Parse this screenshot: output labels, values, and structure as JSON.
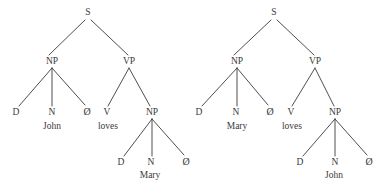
{
  "figure": {
    "title": "",
    "background_color": "#ffffff",
    "ink_color": "#3a3a3a",
    "width": 389,
    "height": 189
  },
  "trees": [
    {
      "id": "tree-left",
      "sentence": "John loves Mary",
      "nodes": [
        {
          "id": "s",
          "label": "S",
          "x": 88,
          "y": 13
        },
        {
          "id": "np1",
          "label": "NP",
          "x": 52,
          "y": 62
        },
        {
          "id": "vp",
          "label": "VP",
          "x": 129,
          "y": 62
        },
        {
          "id": "d1",
          "label": "D",
          "x": 16,
          "y": 113
        },
        {
          "id": "n1",
          "label": "N",
          "x": 52,
          "y": 113
        },
        {
          "id": "null1",
          "label": "Ø",
          "x": 87,
          "y": 112
        },
        {
          "id": "v",
          "label": "V",
          "x": 107,
          "y": 113
        },
        {
          "id": "np2",
          "label": "NP",
          "x": 152,
          "y": 113
        },
        {
          "id": "d2",
          "label": "D",
          "x": 121,
          "y": 163
        },
        {
          "id": "n2",
          "label": "N",
          "x": 151,
          "y": 163
        },
        {
          "id": "null2",
          "label": "Ø",
          "x": 186,
          "y": 162
        }
      ],
      "words": [
        {
          "id": "w-john",
          "label": "John",
          "x": 52,
          "y": 127
        },
        {
          "id": "w-loves",
          "label": "loves",
          "x": 108,
          "y": 127
        },
        {
          "id": "w-mary",
          "label": "Mary",
          "x": 150,
          "y": 176
        }
      ],
      "edges": [
        {
          "from": "s",
          "to": "np1",
          "x1": 85,
          "y1": 20,
          "x2": 49,
          "y2": 55
        },
        {
          "from": "s",
          "to": "vp",
          "x1": 91,
          "y1": 20,
          "x2": 128,
          "y2": 55
        },
        {
          "from": "np1",
          "to": "d1",
          "x1": 52,
          "y1": 68,
          "x2": 19,
          "y2": 106
        },
        {
          "from": "np1",
          "to": "n1",
          "x1": 52,
          "y1": 68,
          "x2": 52,
          "y2": 106
        },
        {
          "from": "np1",
          "to": "null1",
          "x1": 52,
          "y1": 68,
          "x2": 85,
          "y2": 105
        },
        {
          "from": "vp",
          "to": "v",
          "x1": 129,
          "y1": 68,
          "x2": 108,
          "y2": 106
        },
        {
          "from": "vp",
          "to": "np2",
          "x1": 129,
          "y1": 68,
          "x2": 150,
          "y2": 106
        },
        {
          "from": "np2",
          "to": "d2",
          "x1": 152,
          "y1": 119,
          "x2": 124,
          "y2": 156
        },
        {
          "from": "np2",
          "to": "n2",
          "x1": 152,
          "y1": 119,
          "x2": 152,
          "y2": 156
        },
        {
          "from": "np2",
          "to": "null2",
          "x1": 152,
          "y1": 119,
          "x2": 184,
          "y2": 155
        }
      ]
    },
    {
      "id": "tree-right",
      "sentence": "Mary loves John",
      "nodes": [
        {
          "id": "s",
          "label": "S",
          "x": 274,
          "y": 13
        },
        {
          "id": "np1",
          "label": "NP",
          "x": 237,
          "y": 62
        },
        {
          "id": "vp",
          "label": "VP",
          "x": 315,
          "y": 62
        },
        {
          "id": "d1",
          "label": "D",
          "x": 199,
          "y": 113
        },
        {
          "id": "n1",
          "label": "N",
          "x": 236,
          "y": 113
        },
        {
          "id": "null1",
          "label": "Ø",
          "x": 270,
          "y": 112
        },
        {
          "id": "v",
          "label": "V",
          "x": 291,
          "y": 113
        },
        {
          "id": "np2",
          "label": "NP",
          "x": 335,
          "y": 113
        },
        {
          "id": "d2",
          "label": "D",
          "x": 300,
          "y": 163
        },
        {
          "id": "n2",
          "label": "N",
          "x": 335,
          "y": 163
        },
        {
          "id": "null2",
          "label": "Ø",
          "x": 369,
          "y": 162
        }
      ],
      "words": [
        {
          "id": "w-mary",
          "label": "Mary",
          "x": 237,
          "y": 127
        },
        {
          "id": "w-loves",
          "label": "loves",
          "x": 292,
          "y": 127
        },
        {
          "id": "w-john",
          "label": "John",
          "x": 334,
          "y": 176
        }
      ],
      "edges": [
        {
          "from": "s",
          "to": "np1",
          "x1": 271,
          "y1": 20,
          "x2": 234,
          "y2": 55
        },
        {
          "from": "s",
          "to": "vp",
          "x1": 277,
          "y1": 20,
          "x2": 314,
          "y2": 55
        },
        {
          "from": "np1",
          "to": "d1",
          "x1": 237,
          "y1": 68,
          "x2": 202,
          "y2": 106
        },
        {
          "from": "np1",
          "to": "n1",
          "x1": 237,
          "y1": 68,
          "x2": 237,
          "y2": 106
        },
        {
          "from": "np1",
          "to": "null1",
          "x1": 237,
          "y1": 68,
          "x2": 268,
          "y2": 105
        },
        {
          "from": "vp",
          "to": "v",
          "x1": 315,
          "y1": 68,
          "x2": 292,
          "y2": 106
        },
        {
          "from": "vp",
          "to": "np2",
          "x1": 315,
          "y1": 68,
          "x2": 334,
          "y2": 106
        },
        {
          "from": "np2",
          "to": "d2",
          "x1": 335,
          "y1": 119,
          "x2": 303,
          "y2": 156
        },
        {
          "from": "np2",
          "to": "n2",
          "x1": 335,
          "y1": 119,
          "x2": 335,
          "y2": 156
        },
        {
          "from": "np2",
          "to": "null2",
          "x1": 335,
          "y1": 119,
          "x2": 367,
          "y2": 155
        }
      ]
    }
  ]
}
